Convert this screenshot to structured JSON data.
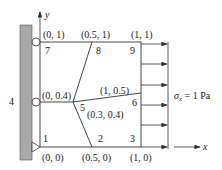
{
  "diagram": {
    "axes": {
      "x_label": "x",
      "y_label": "y"
    },
    "wall_label": "4",
    "load_label_sigma": "σ",
    "load_label_sub": "x",
    "load_label_rest": " = 1 Pa",
    "nodes": [
      {
        "id": "1",
        "coord": "(0, 0)"
      },
      {
        "id": "2",
        "coord": "(0.5, 0)"
      },
      {
        "id": "3",
        "coord": "(1, 0)"
      },
      {
        "id": "5",
        "coord": "(0.3, 0.4)"
      },
      {
        "id": "6",
        "coord": "(1, 0.5)"
      },
      {
        "id": "7",
        "coord": "(0, 1)"
      },
      {
        "id": "8",
        "coord": "(0.5, 1)"
      },
      {
        "id": "9",
        "coord": "(1, 1)"
      },
      {
        "id": "",
        "coord": "(0, 0.4)"
      }
    ],
    "colors": {
      "wall": "#a8a8a8",
      "line": "#333333"
    }
  }
}
